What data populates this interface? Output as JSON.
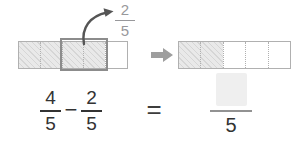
{
  "colors": {
    "bar_border": "#b0b0b0",
    "hatch_fill": "#e9e9e9",
    "hatch_line": "#d6d6d6",
    "divider": "#b0b0b0",
    "highlight_border": "#8c8c8c",
    "arrow": "#555555",
    "label_gray": "#98989b",
    "block_arrow": "#9e9e9e",
    "equation_text": "#333333",
    "answer_box_fill": "#efefef",
    "answer_line": "#929292"
  },
  "diagram": {
    "left_bar": {
      "total_segments": 5,
      "shaded_segments": 4,
      "highlighted_segment_count": 2
    },
    "callout_fraction": {
      "numerator": "2",
      "denominator": "5"
    },
    "right_bar": {
      "total_segments": 5,
      "shaded_segments": 2
    }
  },
  "equation": {
    "minuend": {
      "numerator": "4",
      "denominator": "5"
    },
    "operator": "−",
    "subtrahend": {
      "numerator": "2",
      "denominator": "5"
    },
    "equals": "=",
    "result": {
      "numerator_blank": true,
      "denominator": "5"
    }
  }
}
